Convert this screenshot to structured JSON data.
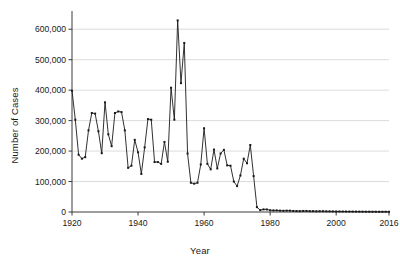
{
  "chart_data": {
    "type": "line",
    "title": "",
    "xlabel": "Year",
    "ylabel": "Number of Cases",
    "xlim": [
      1920,
      2016
    ],
    "ylim": [
      0,
      650000
    ],
    "grid": true,
    "grid_axis": "y",
    "legend": "none",
    "marker": "square",
    "line_color": "#1a1a1a",
    "xticks": [
      1920,
      1940,
      1960,
      1980,
      2000,
      2016
    ],
    "xtick_labels": [
      "1920",
      "1940",
      "1960",
      "1980",
      "2000",
      "2016"
    ],
    "yticks": [
      0,
      100000,
      200000,
      300000,
      400000,
      500000,
      600000
    ],
    "ytick_labels": [
      "0",
      "100,000",
      "200,000",
      "300,000",
      "400,000",
      "500,000",
      "600,000"
    ],
    "x": [
      1920,
      1921,
      1922,
      1923,
      1924,
      1925,
      1926,
      1927,
      1928,
      1929,
      1930,
      1931,
      1932,
      1933,
      1934,
      1935,
      1936,
      1937,
      1938,
      1939,
      1940,
      1941,
      1942,
      1943,
      1944,
      1945,
      1946,
      1947,
      1948,
      1949,
      1950,
      1951,
      1952,
      1953,
      1954,
      1955,
      1956,
      1957,
      1958,
      1959,
      1960,
      1961,
      1962,
      1963,
      1964,
      1965,
      1966,
      1967,
      1968,
      1969,
      1970,
      1971,
      1972,
      1973,
      1974,
      1975,
      1976,
      1977,
      1978,
      1979,
      1980,
      1981,
      1982,
      1983,
      1984,
      1985,
      1986,
      1987,
      1988,
      1989,
      1990,
      1991,
      1992,
      1993,
      1994,
      1995,
      1996,
      1997,
      1998,
      1999,
      2000,
      2001,
      2002,
      2003,
      2004,
      2005,
      2006,
      2007,
      2008,
      2009,
      2010,
      2011,
      2012,
      2013,
      2014,
      2015,
      2016
    ],
    "values": [
      398000,
      303000,
      188000,
      175000,
      180000,
      268000,
      325000,
      323000,
      265000,
      193000,
      360000,
      255000,
      216000,
      325000,
      330000,
      328000,
      268000,
      145000,
      152000,
      237000,
      196000,
      125000,
      212000,
      305000,
      303000,
      164000,
      164000,
      158000,
      230000,
      165000,
      408000,
      303000,
      629000,
      423000,
      555000,
      192000,
      96000,
      93000,
      96000,
      156000,
      275000,
      158000,
      140000,
      205000,
      143000,
      192000,
      204000,
      153000,
      152000,
      100000,
      85000,
      120000,
      175000,
      160000,
      220000,
      118000,
      16000,
      6200,
      8600,
      8400,
      5700,
      5200,
      5300,
      4500,
      4000,
      4500,
      4300,
      3400,
      3100,
      3000,
      3400,
      3400,
      2800,
      2800,
      2400,
      2600,
      2600,
      2200,
      2100,
      1900,
      1800,
      1700,
      1600,
      1500,
      1400,
      1400,
      1300,
      1200,
      1100,
      1000,
      1000,
      900,
      900,
      800,
      800,
      800,
      700
    ]
  },
  "axis_titles": {
    "y": "Number of Cases",
    "x": "Year"
  }
}
